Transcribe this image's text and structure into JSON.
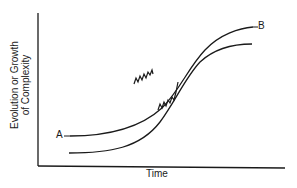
{
  "diagram": {
    "y_axis_label_line1": "Evolution or Growth",
    "y_axis_label_line2": "of Complexity",
    "x_axis_label": "Time",
    "curve_start_label": "A",
    "curve_end_label": "B",
    "colors": {
      "line": "#1a1a1a",
      "background": "#ffffff"
    }
  }
}
